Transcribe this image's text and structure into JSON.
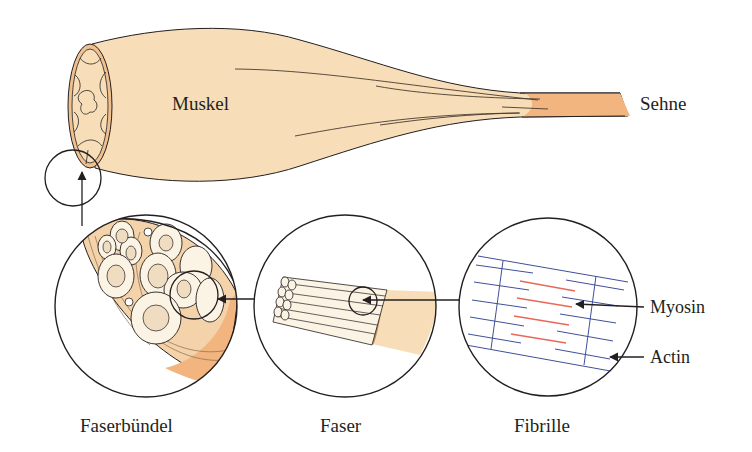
{
  "diagram": {
    "type": "anatomical-hierarchy",
    "labels": {
      "muscle": "Muskel",
      "tendon": "Sehne",
      "fiber_bundle": "Faserbündel",
      "fiber": "Faser",
      "fibril": "Fibrille",
      "myosin": "Myosin",
      "actin": "Actin"
    },
    "zoom_chain": [
      {
        "from": "Muskel",
        "to": "Faserbündel"
      },
      {
        "from": "Faserbündel",
        "to": "Faser"
      },
      {
        "from": "Faser",
        "to": "Fibrille"
      }
    ],
    "colors": {
      "muscle_fill": "#f7deb8",
      "tendon_fill": "#f2b57f",
      "rim_fill": "#f0c08f",
      "fascia_fill": "#f5d3aa",
      "fiber_cell_fill": "#fbf3e4",
      "nucleus_fill": "#f0dcc0",
      "actin_line": "#3f4f9a",
      "myosin_line": "#e8685a",
      "outline": "#231f20"
    }
  }
}
